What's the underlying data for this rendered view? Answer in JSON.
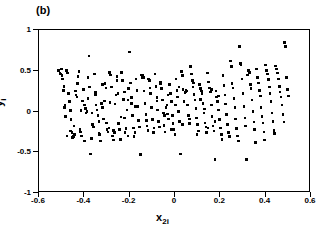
{
  "chart_data": {
    "type": "scatter",
    "title": "(b)",
    "xlabel": "x2i",
    "xlabel_base": "x",
    "xlabel_sub": "2i",
    "ylabel": "yi",
    "ylabel_base": "y",
    "ylabel_sub": "i",
    "xlim": [
      -0.6,
      0.6
    ],
    "ylim": [
      -1,
      1
    ],
    "xticks": [
      -0.6,
      -0.4,
      -0.2,
      0,
      0.2,
      0.4,
      0.6
    ],
    "xticklabels": [
      "-0.6",
      "-0.4",
      "-0.2",
      "0",
      "0.2",
      "0.4",
      "0.6"
    ],
    "yticks": [
      1,
      0.5,
      0,
      -0.5,
      -1
    ],
    "yticklabels": [
      "1",
      "0.5",
      "0",
      "-0.5",
      "-1"
    ],
    "grid": false,
    "legend": null,
    "marker": "square",
    "marker_color": "#000000",
    "marker_size_px": 2.6,
    "n_points": 300,
    "x": [
      -0.515,
      -0.508,
      -0.5,
      -0.498,
      -0.496,
      -0.492,
      -0.488,
      -0.485,
      -0.482,
      -0.478,
      -0.474,
      -0.47,
      -0.466,
      -0.462,
      -0.458,
      -0.455,
      -0.452,
      -0.448,
      -0.444,
      -0.44,
      -0.436,
      -0.432,
      -0.428,
      -0.424,
      -0.42,
      -0.416,
      -0.412,
      -0.408,
      -0.404,
      -0.4,
      -0.396,
      -0.392,
      -0.388,
      -0.384,
      -0.38,
      -0.376,
      -0.372,
      -0.368,
      -0.364,
      -0.36,
      -0.356,
      -0.352,
      -0.348,
      -0.344,
      -0.34,
      -0.336,
      -0.332,
      -0.328,
      -0.324,
      -0.32,
      -0.316,
      -0.312,
      -0.308,
      -0.304,
      -0.3,
      -0.296,
      -0.292,
      -0.288,
      -0.284,
      -0.28,
      -0.276,
      -0.272,
      -0.268,
      -0.264,
      -0.26,
      -0.256,
      -0.252,
      -0.248,
      -0.244,
      -0.24,
      -0.236,
      -0.232,
      -0.228,
      -0.224,
      -0.22,
      -0.216,
      -0.212,
      -0.208,
      -0.204,
      -0.2,
      -0.196,
      -0.192,
      -0.188,
      -0.184,
      -0.18,
      -0.176,
      -0.172,
      -0.168,
      -0.164,
      -0.16,
      -0.156,
      -0.152,
      -0.148,
      -0.144,
      -0.14,
      -0.136,
      -0.132,
      -0.128,
      -0.124,
      -0.12,
      -0.116,
      -0.112,
      -0.108,
      -0.104,
      -0.1,
      -0.096,
      -0.092,
      -0.088,
      -0.084,
      -0.08,
      -0.076,
      -0.072,
      -0.068,
      -0.064,
      -0.06,
      -0.056,
      -0.052,
      -0.048,
      -0.044,
      -0.04,
      -0.036,
      -0.032,
      -0.028,
      -0.024,
      -0.02,
      -0.016,
      -0.012,
      -0.008,
      -0.004,
      0.0,
      0.004,
      0.008,
      0.012,
      0.016,
      0.02,
      0.024,
      0.028,
      0.032,
      0.036,
      0.04,
      0.044,
      0.048,
      0.052,
      0.056,
      0.06,
      0.064,
      0.068,
      0.072,
      0.076,
      0.08,
      0.084,
      0.088,
      0.092,
      0.096,
      0.1,
      0.104,
      0.108,
      0.112,
      0.116,
      0.12,
      0.124,
      0.128,
      0.132,
      0.136,
      0.14,
      0.144,
      0.148,
      0.152,
      0.156,
      0.16,
      0.164,
      0.168,
      0.172,
      0.176,
      0.18,
      0.184,
      0.188,
      0.192,
      0.196,
      0.2,
      0.204,
      0.208,
      0.212,
      0.216,
      0.22,
      0.224,
      0.228,
      0.232,
      0.236,
      0.24,
      0.244,
      0.248,
      0.252,
      0.256,
      0.26,
      0.264,
      0.268,
      0.272,
      0.276,
      0.28,
      0.284,
      0.288,
      0.292,
      0.296,
      0.3,
      0.304,
      0.308,
      0.312,
      0.316,
      0.32,
      0.324,
      0.328,
      0.332,
      0.336,
      0.34,
      0.344,
      0.348,
      0.352,
      0.356,
      0.36,
      0.364,
      0.368,
      0.372,
      0.376,
      0.38,
      0.384,
      0.388,
      0.392,
      0.396,
      0.4,
      0.404,
      0.408,
      0.412,
      0.416,
      0.42,
      0.424,
      0.428,
      0.432,
      0.436,
      0.44,
      0.444,
      0.448,
      0.452,
      0.456,
      0.46,
      0.464,
      0.468,
      0.472,
      0.476,
      0.48,
      0.484,
      0.488,
      0.492,
      0.496,
      0.5,
      -0.505,
      -0.49,
      -0.476,
      -0.461,
      -0.446,
      -0.431,
      -0.415,
      -0.399,
      -0.383,
      -0.367,
      -0.351,
      -0.335,
      -0.319,
      -0.303,
      -0.287,
      -0.271,
      -0.255,
      -0.239,
      -0.223,
      -0.207,
      -0.191,
      -0.175,
      -0.159,
      -0.143,
      -0.127,
      -0.111,
      -0.095,
      -0.079,
      -0.063,
      -0.047,
      -0.031,
      -0.015,
      0.001,
      0.017,
      0.033,
      0.049,
      0.065,
      0.081,
      0.097,
      0.113,
      0.129,
      0.145,
      0.161,
      0.177,
      0.193
    ],
    "y": [
      0.5,
      0.47,
      0.52,
      0.44,
      0.4,
      0.26,
      0.05,
      0.08,
      -0.06,
      0.5,
      0.47,
      0.22,
      0.12,
      0.01,
      -0.1,
      -0.26,
      -0.32,
      -0.31,
      -0.28,
      0.25,
      0.2,
      0.18,
      0.43,
      0.49,
      -0.22,
      -0.25,
      -0.3,
      0.13,
      0.27,
      0.08,
      0.04,
      -0.02,
      0.0,
      0.42,
      0.68,
      0.3,
      -0.52,
      -0.33,
      -0.16,
      -0.19,
      0.46,
      0.24,
      0.08,
      0.02,
      -0.05,
      -0.12,
      -0.28,
      -0.36,
      0.1,
      0.05,
      -0.09,
      0.13,
      0.34,
      0.29,
      -0.22,
      -0.25,
      -0.2,
      0.48,
      0.45,
      0.3,
      -0.3,
      -0.35,
      -0.26,
      0.09,
      0.2,
      0.43,
      0.22,
      -0.15,
      -0.22,
      -0.34,
      0.48,
      0.38,
      0.15,
      -0.08,
      -0.26,
      -0.21,
      0.02,
      0.14,
      0.28,
      0.73,
      0.35,
      0.1,
      -0.05,
      -0.2,
      -0.31,
      -0.26,
      0.4,
      0.26,
      0.06,
      -0.11,
      -0.19,
      -0.53,
      0.45,
      0.44,
      0.42,
      0.25,
      0.1,
      -0.04,
      -0.18,
      -0.23,
      0.4,
      0.38,
      0.22,
      0.05,
      -0.1,
      -0.25,
      -0.2,
      0.46,
      0.31,
      0.17,
      0.02,
      -0.12,
      -0.19,
      0.34,
      0.28,
      0.14,
      -0.02,
      -0.17,
      -0.25,
      0.05,
      0.08,
      -0.03,
      -0.09,
      0.33,
      0.22,
      0.12,
      -0.05,
      -0.15,
      -0.22,
      -0.28,
      0.4,
      0.26,
      0.18,
      0.0,
      -0.12,
      -0.52,
      0.49,
      0.44,
      0.27,
      0.12,
      0.23,
      0.26,
      0.25,
      0.08,
      -0.05,
      -0.15,
      0.55,
      0.46,
      0.38,
      0.3,
      0.21,
      0.14,
      0.04,
      -0.08,
      -0.16,
      -0.24,
      0.33,
      0.28,
      0.25,
      0.22,
      0.1,
      -0.02,
      -0.14,
      -0.19,
      -0.26,
      0.47,
      0.36,
      0.29,
      0.24,
      0.08,
      -0.06,
      -0.18,
      -0.24,
      -0.59,
      0.25,
      0.18,
      0.12,
      0.02,
      -0.1,
      -0.2,
      -0.28,
      -0.34,
      0.44,
      0.32,
      0.2,
      0.09,
      -0.04,
      -0.16,
      -0.26,
      -0.31,
      0.62,
      0.55,
      0.34,
      0.29,
      0.16,
      0.05,
      -0.09,
      -0.21,
      -0.3,
      -0.36,
      0.8,
      0.59,
      0.58,
      0.4,
      0.22,
      0.06,
      -0.08,
      -0.18,
      -0.59,
      0.45,
      0.5,
      0.48,
      0.33,
      0.28,
      0.14,
      0.0,
      -0.13,
      -0.22,
      -0.38,
      0.52,
      0.42,
      0.35,
      0.26,
      0.19,
      0.05,
      -0.06,
      -0.14,
      -0.25,
      -0.35,
      0.57,
      0.5,
      0.46,
      0.39,
      0.3,
      0.22,
      0.12,
      -0.02,
      -0.12,
      -0.23,
      -0.27,
      0.56,
      0.52,
      0.47,
      0.4,
      0.31,
      0.24,
      0.18,
      0.08,
      -0.04,
      -0.13,
      0.85,
      0.8,
      0.42,
      0.27,
      0.19,
      0.46,
      0.31,
      -0.3,
      -0.24,
      -0.18,
      0.34,
      0.01,
      -0.36,
      0.16,
      -0.02,
      0.21,
      -0.27,
      0.33,
      -0.14,
      0.11,
      -0.23,
      0.38,
      -0.07,
      0.24,
      -0.3,
      0.17,
      0.06,
      -0.19,
      0.41,
      -0.11,
      0.29,
      -0.26,
      0.13,
      0.36,
      -0.05,
      0.2,
      -0.22,
      0.08,
      0.3,
      -0.16,
      0.24,
      -0.09,
      0.35,
      -0.28,
      0.15,
      0.03,
      -0.2,
      0.27,
      -0.12,
      0.19
    ]
  }
}
